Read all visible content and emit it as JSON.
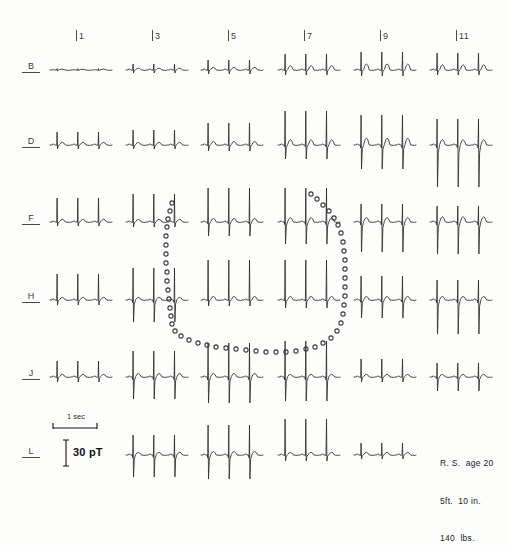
{
  "figure": {
    "background_color": "#fdfdfc",
    "trace_color": "#2a2a2a",
    "dot_color": "#3a3a3a",
    "label_color": "#3b3b3b"
  },
  "axes": {
    "column_labels": [
      "1",
      "3",
      "5",
      "7",
      "9",
      "11"
    ],
    "column_x": [
      79,
      155,
      230,
      307,
      383,
      459
    ],
    "row_labels": [
      "B",
      "D",
      "F",
      "H",
      "J",
      "L"
    ],
    "row_y": [
      70,
      145,
      222,
      300,
      377,
      455
    ]
  },
  "legend": {
    "time_label": "1 sec",
    "amplitude_label": "30 pT",
    "time_bar_x": 53,
    "time_bar_y": 428,
    "time_bar_width": 44,
    "amp_bar_x": 66,
    "amp_bar_y": 440,
    "amp_bar_height": 26
  },
  "subject": {
    "line1": "R. S.  age 20",
    "line2": "5ft.  10 in.",
    "line3": "140  lbs.",
    "x": 440,
    "y": 436
  },
  "chart_data": {
    "type": "line",
    "xlabel": "Measurement column",
    "ylabel": "Measurement row",
    "grid": false,
    "legend_position": "bottom-left",
    "categories": [
      "1",
      "3",
      "5",
      "7",
      "9",
      "11"
    ],
    "rows": [
      "B",
      "D",
      "F",
      "H",
      "J",
      "L"
    ],
    "units": {
      "time": "1 sec",
      "amplitude": "30 pT"
    },
    "annotations": [
      "R. S.  age 20",
      "5ft.  10 in.",
      "140  lbs."
    ],
    "cells": [
      {
        "row": "B",
        "col": "1",
        "x": 50,
        "y": 70,
        "w": 62,
        "beats": 3,
        "r_amp": 3,
        "s_amp": 2,
        "t_amp": 2,
        "p_amp": 1.5,
        "flat": true
      },
      {
        "row": "B",
        "col": "3",
        "x": 126,
        "y": 70,
        "w": 62,
        "beats": 3,
        "r_amp": 6,
        "s_amp": 3,
        "t_amp": 2,
        "p_amp": 2
      },
      {
        "row": "B",
        "col": "5",
        "x": 201,
        "y": 70,
        "w": 62,
        "beats": 3,
        "r_amp": 10,
        "s_amp": 4,
        "t_amp": 3,
        "p_amp": 2
      },
      {
        "row": "B",
        "col": "7",
        "x": 278,
        "y": 70,
        "w": 62,
        "beats": 3,
        "r_amp": 16,
        "s_amp": 5,
        "t_amp": 5,
        "p_amp": 2
      },
      {
        "row": "B",
        "col": "9",
        "x": 354,
        "y": 70,
        "w": 62,
        "beats": 3,
        "r_amp": 18,
        "s_amp": 6,
        "t_amp": 7,
        "p_amp": 2
      },
      {
        "row": "B",
        "col": "11",
        "x": 430,
        "y": 70,
        "w": 62,
        "beats": 3,
        "r_amp": 17,
        "s_amp": 5,
        "t_amp": 6,
        "p_amp": 2
      },
      {
        "row": "D",
        "col": "1",
        "x": 50,
        "y": 145,
        "w": 62,
        "beats": 3,
        "r_amp": 13,
        "s_amp": 4,
        "t_amp": 3,
        "p_amp": 2
      },
      {
        "row": "D",
        "col": "3",
        "x": 126,
        "y": 145,
        "w": 62,
        "beats": 3,
        "r_amp": 15,
        "s_amp": 4,
        "t_amp": 3,
        "p_amp": 2
      },
      {
        "row": "D",
        "col": "5",
        "x": 201,
        "y": 145,
        "w": 62,
        "beats": 3,
        "r_amp": 22,
        "s_amp": 6,
        "t_amp": 4,
        "p_amp": 2
      },
      {
        "row": "D",
        "col": "7",
        "x": 278,
        "y": 145,
        "w": 62,
        "beats": 3,
        "r_amp": 34,
        "s_amp": 14,
        "t_amp": 6,
        "p_amp": 2
      },
      {
        "row": "D",
        "col": "9",
        "x": 354,
        "y": 145,
        "w": 62,
        "beats": 3,
        "r_amp": 30,
        "s_amp": 24,
        "t_amp": 8,
        "p_amp": 2
      },
      {
        "row": "D",
        "col": "11",
        "x": 430,
        "y": 145,
        "w": 62,
        "beats": 3,
        "r_amp": 26,
        "s_amp": 42,
        "t_amp": 6,
        "p_amp": 2
      },
      {
        "row": "F",
        "col": "1",
        "x": 50,
        "y": 222,
        "w": 62,
        "beats": 3,
        "r_amp": 24,
        "s_amp": 4,
        "t_amp": 3,
        "p_amp": 2
      },
      {
        "row": "F",
        "col": "3",
        "x": 126,
        "y": 222,
        "w": 62,
        "beats": 3,
        "r_amp": 28,
        "s_amp": 5,
        "t_amp": 3,
        "p_amp": 2
      },
      {
        "row": "F",
        "col": "5",
        "x": 201,
        "y": 222,
        "w": 62,
        "beats": 3,
        "r_amp": 34,
        "s_amp": 14,
        "t_amp": 4,
        "p_amp": 2
      },
      {
        "row": "F",
        "col": "7",
        "x": 278,
        "y": 222,
        "w": 62,
        "beats": 3,
        "r_amp": 34,
        "s_amp": 22,
        "t_amp": 5,
        "p_amp": 2
      },
      {
        "row": "F",
        "col": "9",
        "x": 354,
        "y": 222,
        "w": 62,
        "beats": 3,
        "r_amp": 18,
        "s_amp": 30,
        "t_amp": 5,
        "p_amp": 2
      },
      {
        "row": "F",
        "col": "11",
        "x": 430,
        "y": 222,
        "w": 62,
        "beats": 3,
        "r_amp": 16,
        "s_amp": 32,
        "t_amp": 6,
        "p_amp": 2
      },
      {
        "row": "H",
        "col": "1",
        "x": 50,
        "y": 300,
        "w": 62,
        "beats": 3,
        "r_amp": 26,
        "s_amp": 5,
        "t_amp": 3,
        "p_amp": 2
      },
      {
        "row": "H",
        "col": "3",
        "x": 126,
        "y": 300,
        "w": 62,
        "beats": 3,
        "r_amp": 32,
        "s_amp": 22,
        "t_amp": 3,
        "p_amp": 2
      },
      {
        "row": "H",
        "col": "5",
        "x": 201,
        "y": 300,
        "w": 62,
        "beats": 3,
        "r_amp": 40,
        "s_amp": 6,
        "t_amp": 4,
        "p_amp": 2
      },
      {
        "row": "H",
        "col": "7",
        "x": 278,
        "y": 300,
        "w": 62,
        "beats": 3,
        "r_amp": 40,
        "s_amp": 8,
        "t_amp": 4,
        "p_amp": 2
      },
      {
        "row": "H",
        "col": "9",
        "x": 354,
        "y": 300,
        "w": 62,
        "beats": 3,
        "r_amp": 24,
        "s_amp": 18,
        "t_amp": 4,
        "p_amp": 2
      },
      {
        "row": "H",
        "col": "11",
        "x": 430,
        "y": 300,
        "w": 62,
        "beats": 3,
        "r_amp": 20,
        "s_amp": 34,
        "t_amp": 4,
        "p_amp": 2
      },
      {
        "row": "J",
        "col": "1",
        "x": 50,
        "y": 377,
        "w": 62,
        "beats": 3,
        "r_amp": 16,
        "s_amp": 5,
        "t_amp": 3,
        "p_amp": 2
      },
      {
        "row": "J",
        "col": "3",
        "x": 126,
        "y": 377,
        "w": 62,
        "beats": 3,
        "r_amp": 26,
        "s_amp": 22,
        "t_amp": 4,
        "p_amp": 2
      },
      {
        "row": "J",
        "col": "5",
        "x": 201,
        "y": 377,
        "w": 62,
        "beats": 3,
        "r_amp": 34,
        "s_amp": 26,
        "t_amp": 4,
        "p_amp": 2
      },
      {
        "row": "J",
        "col": "7",
        "x": 278,
        "y": 377,
        "w": 62,
        "beats": 3,
        "r_amp": 36,
        "s_amp": 24,
        "t_amp": 3,
        "p_amp": 2
      },
      {
        "row": "J",
        "col": "9",
        "x": 354,
        "y": 377,
        "w": 62,
        "beats": 3,
        "r_amp": 18,
        "s_amp": 5,
        "t_amp": 3,
        "p_amp": 2
      },
      {
        "row": "J",
        "col": "11",
        "x": 430,
        "y": 377,
        "w": 62,
        "beats": 3,
        "r_amp": 14,
        "s_amp": 14,
        "t_amp": 3,
        "p_amp": 2
      },
      {
        "row": "L",
        "col": "3",
        "x": 126,
        "y": 455,
        "w": 62,
        "beats": 3,
        "r_amp": 20,
        "s_amp": 22,
        "t_amp": 3,
        "p_amp": 2
      },
      {
        "row": "L",
        "col": "5",
        "x": 201,
        "y": 455,
        "w": 62,
        "beats": 3,
        "r_amp": 30,
        "s_amp": 24,
        "t_amp": 4,
        "p_amp": 2
      },
      {
        "row": "L",
        "col": "7",
        "x": 278,
        "y": 455,
        "w": 62,
        "beats": 3,
        "r_amp": 36,
        "s_amp": 6,
        "t_amp": 3,
        "p_amp": 2
      },
      {
        "row": "L",
        "col": "9",
        "x": 354,
        "y": 455,
        "w": 62,
        "beats": 3,
        "r_amp": 12,
        "s_amp": 4,
        "t_amp": 3,
        "p_amp": 2
      }
    ],
    "contour": {
      "name": "zero-field-line",
      "style": "dotted",
      "dot_radius": 2.1,
      "points": [
        [
          172,
          203
        ],
        [
          170,
          211
        ],
        [
          168,
          219
        ],
        [
          167,
          227
        ],
        [
          166,
          236
        ],
        [
          166,
          245
        ],
        [
          166,
          254
        ],
        [
          166,
          263
        ],
        [
          167,
          272
        ],
        [
          167,
          281
        ],
        [
          168,
          290
        ],
        [
          169,
          299
        ],
        [
          170,
          308
        ],
        [
          171,
          316
        ],
        [
          172,
          324
        ],
        [
          175,
          331
        ],
        [
          181,
          336
        ],
        [
          189,
          340
        ],
        [
          198,
          343
        ],
        [
          207,
          345
        ],
        [
          216,
          347
        ],
        [
          226,
          348
        ],
        [
          236,
          349
        ],
        [
          246,
          350
        ],
        [
          256,
          351
        ],
        [
          266,
          352
        ],
        [
          276,
          352
        ],
        [
          286,
          352
        ],
        [
          296,
          351
        ],
        [
          306,
          349
        ],
        [
          315,
          347
        ],
        [
          323,
          343
        ],
        [
          331,
          338
        ],
        [
          337,
          331
        ],
        [
          341,
          323
        ],
        [
          343,
          314
        ],
        [
          344,
          305
        ],
        [
          345,
          296
        ],
        [
          345,
          287
        ],
        [
          345,
          278
        ],
        [
          345,
          269
        ],
        [
          345,
          260
        ],
        [
          344,
          251
        ],
        [
          343,
          242
        ],
        [
          341,
          233
        ],
        [
          338,
          225
        ],
        [
          334,
          218
        ],
        [
          329,
          211
        ],
        [
          323,
          205
        ],
        [
          317,
          199
        ],
        [
          311,
          194
        ]
      ]
    }
  }
}
